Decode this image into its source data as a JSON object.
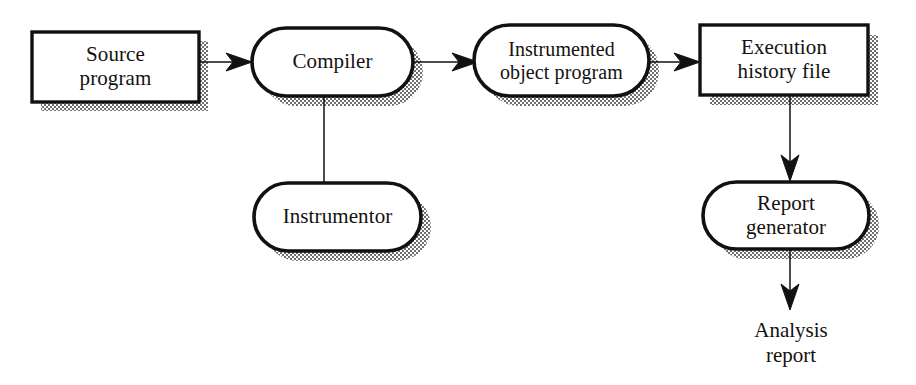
{
  "figure": {
    "background_color": "#ffffff",
    "line_color": "#111111",
    "shadow_color": "#8a8a8a"
  },
  "nodes": [
    {
      "id": "source-program",
      "shape": "rectangle",
      "lines": [
        "Source",
        "program"
      ],
      "line1": "Source",
      "line2": "program"
    },
    {
      "id": "compiler",
      "shape": "rounded-pill",
      "lines": [
        "Compiler"
      ],
      "line1": "Compiler",
      "line2": ""
    },
    {
      "id": "instrumented-object-program",
      "shape": "rounded-pill",
      "lines": [
        "Instrumented",
        "object program"
      ],
      "line1": "Instrumented",
      "line2": "object program"
    },
    {
      "id": "execution-history-file",
      "shape": "rectangle",
      "lines": [
        "Execution",
        "history file"
      ],
      "line1": "Execution",
      "line2": "history file"
    },
    {
      "id": "instrumentor",
      "shape": "rounded-pill",
      "lines": [
        "Instrumentor"
      ],
      "line1": "Instrumentor",
      "line2": ""
    },
    {
      "id": "report-generator",
      "shape": "rounded-pill",
      "lines": [
        "Report",
        "generator"
      ],
      "line1": "Report",
      "line2": "generator"
    }
  ],
  "free_labels": [
    {
      "id": "analysis-report",
      "line1": "Analysis",
      "line2": "report"
    }
  ],
  "connectors": [
    {
      "id": "source-to-compiler",
      "from": "source-program",
      "to": "compiler",
      "arrow": true,
      "direction": "right"
    },
    {
      "id": "compiler-to-iop",
      "from": "compiler",
      "to": "instrumented-object-program",
      "arrow": true,
      "direction": "right"
    },
    {
      "id": "iop-to-ehf",
      "from": "instrumented-object-program",
      "to": "execution-history-file",
      "arrow": true,
      "direction": "right"
    },
    {
      "id": "compiler-to-instrumentor",
      "from": "compiler",
      "to": "instrumentor",
      "arrow": false,
      "direction": "down"
    },
    {
      "id": "ehf-to-report-generator",
      "from": "execution-history-file",
      "to": "report-generator",
      "arrow": true,
      "direction": "down"
    },
    {
      "id": "report-generator-to-analysis",
      "from": "report-generator",
      "to": "analysis-report",
      "arrow": true,
      "direction": "down"
    }
  ]
}
